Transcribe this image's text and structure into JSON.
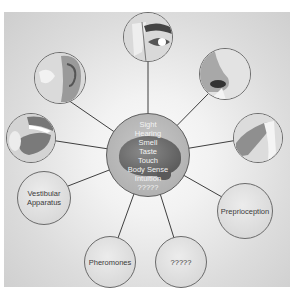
{
  "diagram": {
    "type": "hub-and-spoke",
    "center": {
      "icon": "brain-icon",
      "senses": [
        "Sight",
        "Hearing",
        "Smell",
        "Taste",
        "Touch",
        "Body Sense",
        "Intuition",
        "?????"
      ]
    },
    "outer_nodes": [
      {
        "id": "eye",
        "icon": "eye-icon",
        "label": ""
      },
      {
        "id": "ear",
        "icon": "ear-icon",
        "label": ""
      },
      {
        "id": "nose",
        "icon": "nose-icon",
        "label": ""
      },
      {
        "id": "mouth",
        "icon": "mouth-tongue-icon",
        "label": ""
      },
      {
        "id": "finger",
        "icon": "finger-touch-icon",
        "label": ""
      },
      {
        "id": "vestibular",
        "icon": "",
        "label": "Vestibular Apparatus",
        "lines": [
          "Vestibular",
          "Apparatus"
        ]
      },
      {
        "id": "preprioception",
        "icon": "",
        "label": "Preprioception"
      },
      {
        "id": "pheromones",
        "icon": "",
        "label": "Pheromones"
      },
      {
        "id": "unknown",
        "icon": "",
        "label": "?????"
      }
    ],
    "colors": {
      "background": "#e2e2e2",
      "line": "#3f3f3f",
      "center_fill": "#b5b5b5",
      "center_text": "#f3f3f3",
      "node_text": "#3a3a3a"
    }
  }
}
